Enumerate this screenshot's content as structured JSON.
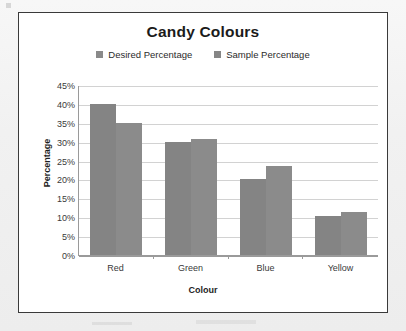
{
  "chart_data": {
    "type": "bar",
    "title": "Candy Colours",
    "xlabel": "Colour",
    "ylabel": "Percentage",
    "categories": [
      "Red",
      "Green",
      "Blue",
      "Yellow"
    ],
    "series": [
      {
        "name": "Desired Percentage",
        "values": [
          40,
          30,
          20,
          10.2
        ],
        "color": "#848484"
      },
      {
        "name": "Sample Percentage",
        "values": [
          35,
          30.7,
          23.5,
          11.3
        ],
        "color": "#8b8b8b"
      }
    ],
    "ylim": [
      0,
      45
    ],
    "ytick_step": 5,
    "ytick_labels": [
      "45%",
      "40%",
      "35%",
      "30%",
      "25%",
      "20%",
      "15%",
      "10%",
      "5%",
      "0%"
    ],
    "ytick_values": [
      45,
      40,
      35,
      30,
      25,
      20,
      15,
      10,
      5,
      0
    ],
    "grid": true,
    "legend_position": "top"
  },
  "legend": {
    "items": [
      {
        "label": "Desired Percentage"
      },
      {
        "label": "Sample Percentage"
      }
    ]
  },
  "colors": {
    "bar_series_1": "#848484",
    "bar_series_2": "#8b8b8b",
    "gridline": "#d2d2d2",
    "axis": "#9a9a9a",
    "frame": "#3a3a3a",
    "plot_background": "#ffffff",
    "page_background": "#f1f1f1"
  }
}
